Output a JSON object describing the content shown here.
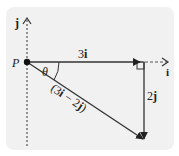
{
  "diagram": {
    "type": "vector-diagram",
    "point_label": "P",
    "axes": {
      "horizontal_label": "i",
      "vertical_label": "j"
    },
    "vectors": [
      {
        "name": "horizontal",
        "label_num": "3",
        "label_unit": "i",
        "from": "P",
        "direction": "right"
      },
      {
        "name": "vertical",
        "label_num": "2",
        "label_unit": "j",
        "direction": "down"
      },
      {
        "name": "resultant",
        "label": "(3i − 2j)",
        "label_parts": {
          "open": "(3",
          "i": "i",
          "minus": " − 2",
          "j": "j",
          "close": ")"
        },
        "from": "P"
      }
    ],
    "angle_label": "θ",
    "right_angle_marker": true
  },
  "colors": {
    "panel": "#f1f1f1",
    "line": "#333333",
    "text": "#222222"
  }
}
